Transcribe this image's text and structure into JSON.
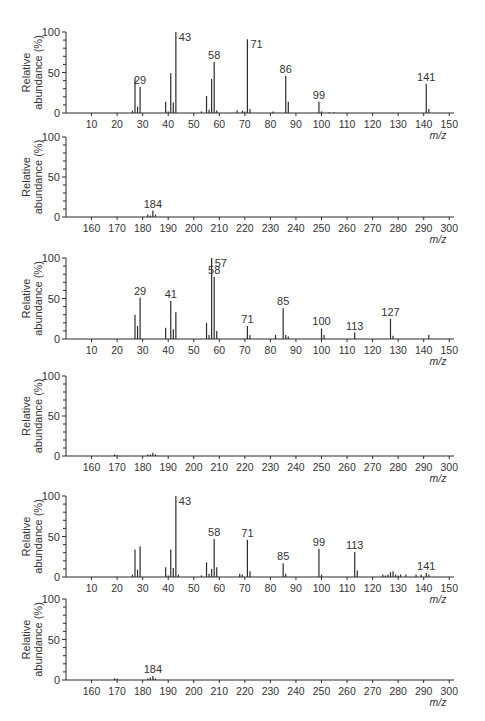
{
  "figure": {
    "ylabel_line1": "Relative",
    "ylabel_line2": "abundance (%)",
    "xlabel": "m/z",
    "y_ticks": [
      0,
      50,
      100
    ]
  },
  "chart_data": [
    {
      "type": "bar",
      "panel": 1,
      "title": "",
      "xlabel": "m/z",
      "ylabel": "Relative abundance (%)",
      "xlim": [
        0,
        155
      ],
      "ylim": [
        0,
        100
      ],
      "x_ticks": [
        10,
        20,
        30,
        40,
        50,
        60,
        70,
        80,
        90,
        100,
        110,
        120,
        130,
        140,
        150
      ],
      "layout": {
        "y100": 32,
        "y0": 113
      },
      "peaks": [
        {
          "x": 26,
          "y": 3
        },
        {
          "x": 27,
          "y": 43,
          "label": ""
        },
        {
          "x": 28,
          "y": 8
        },
        {
          "x": 29,
          "y": 32,
          "label": "29"
        },
        {
          "x": 39,
          "y": 14
        },
        {
          "x": 40,
          "y": 2
        },
        {
          "x": 41,
          "y": 49
        },
        {
          "x": 42,
          "y": 13
        },
        {
          "x": 43,
          "y": 100,
          "label": "43"
        },
        {
          "x": 53,
          "y": 2
        },
        {
          "x": 55,
          "y": 21
        },
        {
          "x": 56,
          "y": 4
        },
        {
          "x": 57,
          "y": 42
        },
        {
          "x": 58,
          "y": 63,
          "label": "58"
        },
        {
          "x": 59,
          "y": 3
        },
        {
          "x": 67,
          "y": 3
        },
        {
          "x": 69,
          "y": 3
        },
        {
          "x": 70,
          "y": 2
        },
        {
          "x": 71,
          "y": 91,
          "label": "71"
        },
        {
          "x": 72,
          "y": 5
        },
        {
          "x": 81,
          "y": 2
        },
        {
          "x": 86,
          "y": 46,
          "label": "86"
        },
        {
          "x": 87,
          "y": 14
        },
        {
          "x": 99,
          "y": 14,
          "label": "99"
        },
        {
          "x": 100,
          "y": 2
        },
        {
          "x": 103,
          "y": 1
        },
        {
          "x": 105,
          "y": 1
        },
        {
          "x": 141,
          "y": 36,
          "label": "141"
        },
        {
          "x": 142,
          "y": 5
        }
      ]
    },
    {
      "type": "bar",
      "panel": 2,
      "xlabel": "m/z",
      "ylabel": "Relative abundance (%)",
      "xlim": [
        150,
        305
      ],
      "ylim": [
        0,
        100
      ],
      "x_ticks": [
        160,
        170,
        180,
        190,
        200,
        210,
        220,
        230,
        240,
        250,
        260,
        270,
        280,
        290,
        300
      ],
      "layout": {
        "y100": 137,
        "y0": 217
      },
      "peaks": [
        {
          "x": 182,
          "y": 3
        },
        {
          "x": 183,
          "y": 2
        },
        {
          "x": 184,
          "y": 8,
          "label": "184"
        },
        {
          "x": 185,
          "y": 3
        }
      ]
    },
    {
      "type": "bar",
      "panel": 3,
      "xlabel": "m/z",
      "ylabel": "Relative abundance (%)",
      "xlim": [
        0,
        155
      ],
      "ylim": [
        0,
        100
      ],
      "x_ticks": [
        10,
        20,
        30,
        40,
        50,
        60,
        70,
        80,
        90,
        100,
        110,
        120,
        130,
        140,
        150
      ],
      "layout": {
        "y100": 258,
        "y0": 339
      },
      "peaks": [
        {
          "x": 27,
          "y": 30
        },
        {
          "x": 28,
          "y": 16
        },
        {
          "x": 29,
          "y": 51,
          "label": "29"
        },
        {
          "x": 39,
          "y": 14
        },
        {
          "x": 41,
          "y": 47,
          "label": "41"
        },
        {
          "x": 42,
          "y": 12
        },
        {
          "x": 43,
          "y": 33
        },
        {
          "x": 55,
          "y": 20
        },
        {
          "x": 56,
          "y": 5
        },
        {
          "x": 57,
          "y": 100,
          "label": "57"
        },
        {
          "x": 58,
          "y": 77,
          "label": "58"
        },
        {
          "x": 59,
          "y": 10
        },
        {
          "x": 71,
          "y": 16,
          "label": "71"
        },
        {
          "x": 72,
          "y": 5
        },
        {
          "x": 82,
          "y": 5
        },
        {
          "x": 85,
          "y": 38,
          "label": "85"
        },
        {
          "x": 86,
          "y": 5
        },
        {
          "x": 87,
          "y": 3
        },
        {
          "x": 100,
          "y": 13,
          "label": "100"
        },
        {
          "x": 101,
          "y": 5
        },
        {
          "x": 113,
          "y": 8,
          "label": "113"
        },
        {
          "x": 127,
          "y": 25,
          "label": "127"
        },
        {
          "x": 128,
          "y": 4
        },
        {
          "x": 142,
          "y": 5
        }
      ]
    },
    {
      "type": "bar",
      "panel": 4,
      "xlabel": "m/z",
      "ylabel": "Relative abundance (%)",
      "xlim": [
        150,
        305
      ],
      "ylim": [
        0,
        100
      ],
      "x_ticks": [
        160,
        170,
        180,
        190,
        200,
        210,
        220,
        230,
        240,
        250,
        260,
        270,
        280,
        290,
        300
      ],
      "layout": {
        "y100": 376,
        "y0": 456
      },
      "peaks": [
        {
          "x": 169,
          "y": 2
        },
        {
          "x": 170,
          "y": 1
        },
        {
          "x": 182,
          "y": 2
        },
        {
          "x": 183,
          "y": 2
        },
        {
          "x": 184,
          "y": 4
        },
        {
          "x": 185,
          "y": 2
        }
      ]
    },
    {
      "type": "bar",
      "panel": 5,
      "xlabel": "m/z",
      "ylabel": "Relative abundance (%)",
      "xlim": [
        0,
        155
      ],
      "ylim": [
        0,
        100
      ],
      "x_ticks": [
        10,
        20,
        30,
        40,
        50,
        60,
        70,
        80,
        90,
        100,
        110,
        120,
        130,
        140,
        150
      ],
      "layout": {
        "y100": 496,
        "y0": 577
      },
      "peaks": [
        {
          "x": 26,
          "y": 3
        },
        {
          "x": 27,
          "y": 34
        },
        {
          "x": 28,
          "y": 9
        },
        {
          "x": 29,
          "y": 38
        },
        {
          "x": 39,
          "y": 12
        },
        {
          "x": 40,
          "y": 2
        },
        {
          "x": 41,
          "y": 34
        },
        {
          "x": 42,
          "y": 11
        },
        {
          "x": 43,
          "y": 100,
          "label": "43"
        },
        {
          "x": 44,
          "y": 3
        },
        {
          "x": 53,
          "y": 2
        },
        {
          "x": 55,
          "y": 18
        },
        {
          "x": 56,
          "y": 4
        },
        {
          "x": 57,
          "y": 10
        },
        {
          "x": 58,
          "y": 47,
          "label": "58"
        },
        {
          "x": 59,
          "y": 12
        },
        {
          "x": 68,
          "y": 4
        },
        {
          "x": 69,
          "y": 3
        },
        {
          "x": 71,
          "y": 46,
          "label": "71"
        },
        {
          "x": 72,
          "y": 7
        },
        {
          "x": 85,
          "y": 17,
          "label": "85"
        },
        {
          "x": 86,
          "y": 4
        },
        {
          "x": 99,
          "y": 35,
          "label": "99"
        },
        {
          "x": 100,
          "y": 3
        },
        {
          "x": 113,
          "y": 31,
          "label": "113"
        },
        {
          "x": 114,
          "y": 8
        },
        {
          "x": 124,
          "y": 3
        },
        {
          "x": 125,
          "y": 2
        },
        {
          "x": 126,
          "y": 3
        },
        {
          "x": 127,
          "y": 6
        },
        {
          "x": 128,
          "y": 7
        },
        {
          "x": 129,
          "y": 3
        },
        {
          "x": 130,
          "y": 2
        },
        {
          "x": 131,
          "y": 3
        },
        {
          "x": 133,
          "y": 3
        },
        {
          "x": 137,
          "y": 3
        },
        {
          "x": 139,
          "y": 3
        },
        {
          "x": 141,
          "y": 5,
          "label": "141"
        },
        {
          "x": 142,
          "y": 3
        }
      ]
    },
    {
      "type": "bar",
      "panel": 6,
      "xlabel": "m/z",
      "ylabel": "Relative abundance (%)",
      "xlim": [
        150,
        305
      ],
      "ylim": [
        0,
        100
      ],
      "x_ticks": [
        160,
        170,
        180,
        190,
        200,
        210,
        220,
        230,
        240,
        250,
        260,
        270,
        280,
        290,
        300
      ],
      "layout": {
        "y100": 599,
        "y0": 680
      },
      "peaks": [
        {
          "x": 169,
          "y": 2
        },
        {
          "x": 170,
          "y": 2
        },
        {
          "x": 182,
          "y": 2
        },
        {
          "x": 183,
          "y": 3
        },
        {
          "x": 184,
          "y": 5,
          "label": "184"
        },
        {
          "x": 185,
          "y": 2
        }
      ]
    }
  ]
}
